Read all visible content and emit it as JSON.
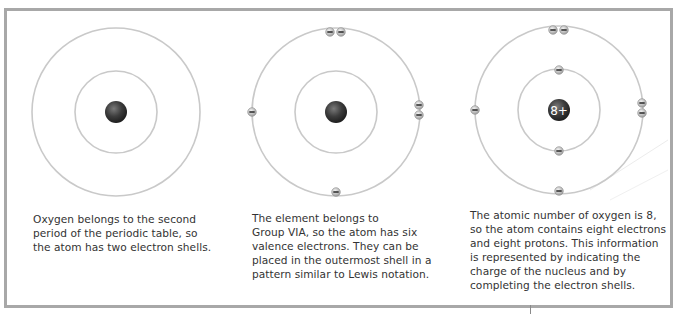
{
  "diagram": {
    "colors": {
      "frame": "#a8a8a8",
      "shell": "#c9c9c9",
      "nucleus": "#3a3a3a",
      "electron_fill": "#d8d8d8",
      "electron_minus": "#333333",
      "text": "#333333"
    },
    "steps": [
      {
        "label": "Step 1: two electron shells",
        "nucleus_label": "",
        "center": [
          116,
          112
        ],
        "shells": [
          41,
          84
        ],
        "electrons": [],
        "caption_lines": [
          "Oxygen belongs to the second",
          "period of the periodic table, so",
          "the atom has two electron shells."
        ]
      },
      {
        "label": "Step 2: six valence electrons",
        "nucleus_label": "",
        "center": [
          336,
          112
        ],
        "shells": [
          41,
          84
        ],
        "electrons": [
          [
            330,
            32
          ],
          [
            341,
            32
          ],
          [
            252,
            112
          ],
          [
            419,
            105
          ],
          [
            419,
            115
          ],
          [
            336,
            192
          ]
        ],
        "caption_lines": [
          "The element belongs to",
          "Group VIA, so the atom has six",
          "valence electrons. They can be",
          "placed in the outermost shell in a",
          "pattern similar to Lewis notation."
        ]
      },
      {
        "label": "Step 3: complete atom",
        "nucleus_label": "8+",
        "center": [
          559,
          110
        ],
        "shells": [
          42,
          84
        ],
        "electrons": [
          [
            553,
            30
          ],
          [
            564,
            30
          ],
          [
            559,
            70
          ],
          [
            559,
            151
          ],
          [
            475,
            110
          ],
          [
            642,
            103
          ],
          [
            642,
            113
          ],
          [
            559,
            191
          ]
        ],
        "caption_lines": [
          "The atomic number of oxygen is 8,",
          "so the atom contains eight electrons",
          "and eight protons. This information",
          "is represented by indicating the",
          "charge of the nucleus and by",
          "completing the electron shells."
        ]
      }
    ],
    "electron_symbol": "−"
  }
}
